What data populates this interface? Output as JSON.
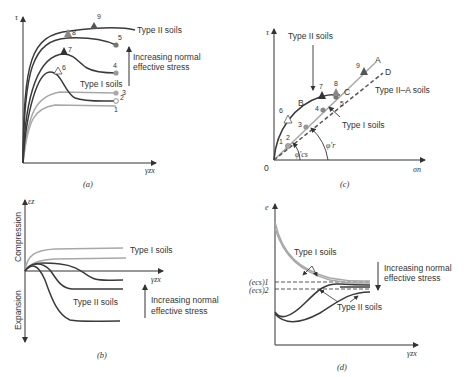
{
  "figure": {
    "panels": {
      "a": {
        "caption": "(a)",
        "y_axis": "τ",
        "x_axis": "γzx",
        "labels": {
          "type2": "Type II soils",
          "type1": "Type I soils",
          "stress_line1": "Increasing normal",
          "stress_line2": "effective stress"
        },
        "points": [
          "1",
          "2",
          "3",
          "4",
          "5",
          "6",
          "7",
          "8",
          "9"
        ]
      },
      "b": {
        "caption": "(b)",
        "y_axis": "εz",
        "x_axis": "γzx",
        "y_up": "Compression",
        "y_down": "Expansion",
        "labels": {
          "type1": "Type I soils",
          "type2": "Type II soils",
          "stress_line1": "Increasing normal",
          "stress_line2": "effective stress"
        }
      },
      "c": {
        "caption": "(c)",
        "y_axis": "τ",
        "x_axis": "σn",
        "origin": "0",
        "labels": {
          "type2": "Type II soils",
          "type2a": "Type II–A soils",
          "type1": "Type I soils",
          "A": "A",
          "B": "B",
          "C": "C",
          "D": "D",
          "phi_cs": "φ'cs",
          "phi_r": "φ'r"
        },
        "points": [
          "1",
          "2",
          "3",
          "4",
          "5",
          "6",
          "7",
          "8",
          "9"
        ]
      },
      "d": {
        "caption": "(d)",
        "y_axis": "e",
        "x_axis": "γzx",
        "labels": {
          "type1": "Type I soils",
          "type2": "Type II soils",
          "ecs1": "(ecs)1",
          "ecs2": "(ecs)2",
          "stress_line1": "Increasing normal",
          "stress_line2": "effective stress"
        }
      }
    },
    "colors": {
      "dark": "#3a3a3a",
      "light": "#a8a8a8",
      "mid": "#7a7a7a"
    }
  }
}
